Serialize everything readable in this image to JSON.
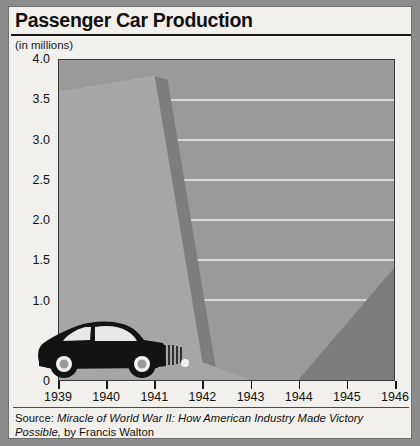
{
  "header": {
    "title": "Passenger Car Production",
    "units": "(in millions)"
  },
  "source": {
    "prefix": "Source: ",
    "book_title": "Miracle of World War II: How American Industry Made Victory Possible,",
    "author": " by Francis Walton"
  },
  "colors": {
    "outer_border": "#8c8c8c",
    "card_background": "#f2f0ec",
    "plot_background": "#9a9a9a",
    "area_fill": "#a6a6a6",
    "area_shadow": "#7d7d7d",
    "area_highlight": "#c4c4c4",
    "gridline": "#ececec",
    "axis": "#3a3a3a",
    "text": "#111111",
    "car": "#131313"
  },
  "icons": {
    "car": "car-icon"
  },
  "chart_data": {
    "type": "area",
    "title": "Passenger Car Production",
    "subtitle": "(in millions)",
    "xlabel": "",
    "ylabel": "(in millions)",
    "categories": [
      "1939",
      "1940",
      "1941",
      "1942",
      "1943",
      "1944",
      "1945",
      "1946"
    ],
    "x": [
      1939,
      1940,
      1941,
      1942,
      1943,
      1944,
      1945,
      1946
    ],
    "values": [
      3.6,
      3.7,
      3.8,
      0.22,
      0.0,
      0.0,
      0.07,
      1.4
    ],
    "series": [
      {
        "name": "Passenger car production",
        "values": [
          3.6,
          3.7,
          3.8,
          0.22,
          0.0,
          0.0,
          0.07,
          1.4
        ]
      }
    ],
    "ylim": [
      0,
      4.0
    ],
    "y_ticks": [
      0,
      1.0,
      1.5,
      2.0,
      2.5,
      3.0,
      3.5,
      4.0
    ],
    "y_tick_labels": [
      "0",
      "1.0",
      "1.5",
      "2.0",
      "2.5",
      "3.0",
      "3.5",
      "4.0"
    ],
    "x_ticks": [
      1939,
      1940,
      1941,
      1942,
      1943,
      1944,
      1945,
      1946
    ],
    "grid": true,
    "grid_axis": "y",
    "legend": false,
    "style": "3d-slab-shaded",
    "annotation": "Silhouette of a 1940s passenger sedan overlaid at lower left"
  }
}
